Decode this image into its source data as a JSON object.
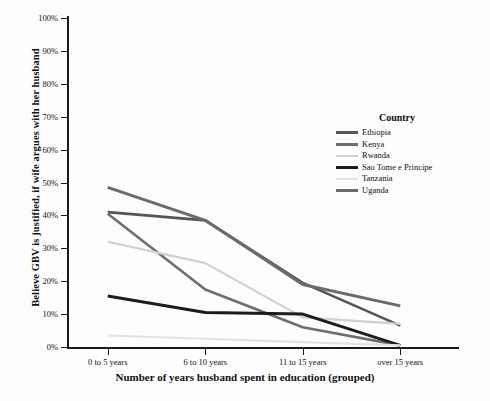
{
  "chart_data": {
    "type": "line",
    "title": "",
    "xlabel": "Number of years husband spent in education (grouped)",
    "ylabel": "Believe GBV is justified, if wife argues with her husband",
    "categories": [
      "0 to 5 years",
      "6 to 10 years",
      "11 to 15 years",
      "over 15 years"
    ],
    "ylim": [
      0,
      100
    ],
    "yticks": [
      "0%",
      "10%",
      "20%",
      "30%",
      "40%",
      "50%",
      "60%",
      "70%",
      "80%",
      "90%",
      "100%"
    ],
    "ytick_values": [
      0,
      10,
      20,
      30,
      40,
      50,
      60,
      70,
      80,
      90,
      100
    ],
    "grid": false,
    "legend_position": "right-middle",
    "legend_title": "Country",
    "series": [
      {
        "name": "Ethiopia",
        "color": "#555555",
        "width": 2.6,
        "values": [
          41.0,
          38.5,
          19.5,
          6.5
        ]
      },
      {
        "name": "Kenya",
        "color": "#6e6e6e",
        "width": 2.6,
        "values": [
          40.5,
          17.5,
          6.0,
          0.5
        ]
      },
      {
        "name": "Rwanda",
        "color": "#d0d0d0",
        "width": 2.2,
        "values": [
          32.0,
          25.5,
          9.0,
          7.0
        ]
      },
      {
        "name": "Sao Tome e Principe",
        "color": "#1c1c1c",
        "width": 3.0,
        "values": [
          15.5,
          10.5,
          10.0,
          0.5
        ]
      },
      {
        "name": "Tanzania",
        "color": "#e2e2e2",
        "width": 2.2,
        "values": [
          3.5,
          2.5,
          1.5,
          0.5
        ]
      },
      {
        "name": "Uganda",
        "color": "#6b6b6b",
        "width": 3.0,
        "values": [
          48.5,
          38.5,
          19.0,
          12.5
        ]
      }
    ]
  },
  "legend": {
    "title": "Country",
    "items": [
      {
        "label": "Ethiopia"
      },
      {
        "label": "Kenya"
      },
      {
        "label": "Rwanda"
      },
      {
        "label": "Sao Tome e Principe"
      },
      {
        "label": "Tanzania"
      },
      {
        "label": "Uganda"
      }
    ]
  }
}
